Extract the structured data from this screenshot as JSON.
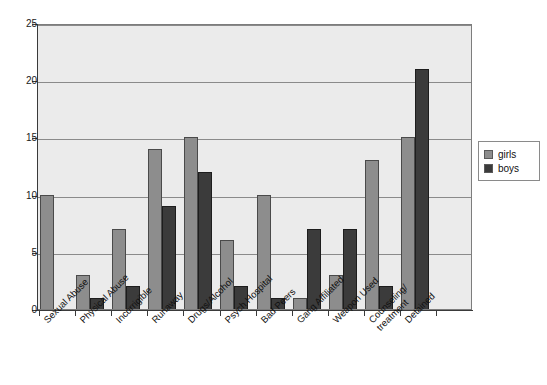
{
  "chart_data": {
    "type": "bar",
    "title": "",
    "subtitle": "",
    "xlabel": "",
    "ylabel": "",
    "ylim": [
      0,
      25
    ],
    "yticks": [
      0,
      5,
      10,
      15,
      20,
      25
    ],
    "grid": true,
    "legend_position": "right",
    "categories": [
      "Sexual Abuse",
      "Physical Abuse",
      "Incorrigible",
      "Runaway",
      "Drugs/Alcohol",
      "Psych Hospital",
      "Bad Peers",
      "Gang Affiliated",
      "Weapon Used",
      "Counseling/\ntreatment",
      "Detained"
    ],
    "series": [
      {
        "name": "girls",
        "color": "#8d8d8d",
        "values": [
          10,
          3,
          7,
          14,
          15,
          6,
          10,
          1,
          3,
          13,
          15
        ]
      },
      {
        "name": "boys",
        "color": "#3b3b3b",
        "values": [
          0,
          1,
          2,
          9,
          12,
          2,
          1,
          7,
          7,
          2,
          21
        ]
      }
    ]
  },
  "legend": {
    "entries": [
      {
        "label": "girls",
        "swatch": "legend-swatch-girls"
      },
      {
        "label": "boys",
        "swatch": "legend-swatch-boys"
      }
    ]
  },
  "axis": {
    "y_tick_labels": [
      "0",
      "5",
      "10",
      "15",
      "20",
      "25"
    ]
  }
}
